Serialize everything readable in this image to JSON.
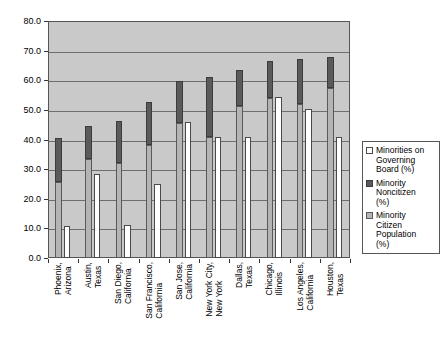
{
  "chart_data": {
    "type": "bar",
    "title": "",
    "xlabel": "",
    "ylabel": "",
    "ylim": [
      0,
      80
    ],
    "ytick_labels": [
      "0.0",
      "10.0",
      "20.0",
      "30.0",
      "40.0",
      "50.0",
      "60.0",
      "70.0",
      "80.0"
    ],
    "ytick_values": [
      0,
      10,
      20,
      30,
      40,
      50,
      60,
      70,
      80
    ],
    "grid": true,
    "legend_position": "right",
    "plot_background": "#c9c9c9",
    "categories": [
      "Phoenix,\nArizona",
      "Austin,\nTexas",
      "San Diego,\nCalifornia",
      "San Francisco,\nCalifornia",
      "San Jose,\nCalifornia",
      "New York City,\nNew York",
      "Dallas,\nTexas",
      "Chicago,\nIllinois",
      "Los Angeles,\nCalifornia",
      "Houston,\nTexas"
    ],
    "series": [
      {
        "name": "Minorities on Governing Board (%)",
        "key": "governing_board",
        "color": "#ffffff",
        "style": "white-outlined",
        "values": [
          10.8,
          28.5,
          11.2,
          25.0,
          45.8,
          41.0,
          41.0,
          54.5,
          50.3,
          41.0
        ]
      },
      {
        "name": "Minority Noncitizen (%)",
        "key": "noncitizen",
        "color": "#5a5a5a",
        "style": "dark-solid",
        "values": [
          14.8,
          11.4,
          14.0,
          14.5,
          14.2,
          20.4,
          12.4,
          12.5,
          15.3,
          10.5
        ]
      },
      {
        "name": "Minority Citizen Population (%)",
        "key": "citizen_population",
        "color": "#b4b4b4",
        "style": "gray",
        "values": [
          25.7,
          33.3,
          32.2,
          38.0,
          45.6,
          40.7,
          51.2,
          54.0,
          52.0,
          57.3
        ]
      }
    ],
    "stacked_totals": [
      40.5,
      44.7,
      46.2,
      52.5,
      59.8,
      61.1,
      63.6,
      66.5,
      67.3,
      67.8
    ]
  },
  "legend": {
    "entries": [
      {
        "label": "Minorities on\nGoverning\nBoard (%)",
        "swatch": "white-swatch"
      },
      {
        "label": "Minority\nNoncitizen\n(%)",
        "swatch": "dark-swatch"
      },
      {
        "label": "Minority\nCitizen\nPopulation\n(%)",
        "swatch": "gray-swatch"
      }
    ]
  }
}
